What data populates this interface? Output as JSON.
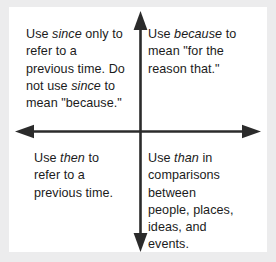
{
  "diagram": {
    "colors": {
      "background": "#ececed",
      "panel": "#ffffff",
      "axis": "#2b2b2b",
      "text": "#1b1b1b"
    },
    "axes": {
      "vertical_label": "vertical-axis-arrow",
      "horizontal_label": "horizontal-axis-arrow",
      "arrow_directions": [
        "up",
        "down",
        "left",
        "right"
      ]
    },
    "quadrants": [
      {
        "id": "top-left",
        "keyword": "since",
        "text_lines": [
          "Use since only to",
          "refer to a",
          "previous time. Do",
          "not use since to",
          "mean \"because.\""
        ],
        "text": "Use since only to refer to a previous time. Do not use since to mean “because.”"
      },
      {
        "id": "top-right",
        "keyword": "because",
        "text_lines": [
          "Use because to",
          "mean \"for the",
          "reason that.\""
        ],
        "text": "Use because to mean “for the reason that.”"
      },
      {
        "id": "bottom-left",
        "keyword": "then",
        "text_lines": [
          "Use then to",
          "refer to a",
          "previous time."
        ],
        "text": "Use then to refer to a previous time."
      },
      {
        "id": "bottom-right",
        "keyword": "than",
        "text_lines": [
          "Use than in",
          "comparisons",
          "between",
          "people, places,",
          "ideas, and",
          "events."
        ],
        "text": "Use than in comparisons between people, places, ideas, and events."
      }
    ]
  }
}
